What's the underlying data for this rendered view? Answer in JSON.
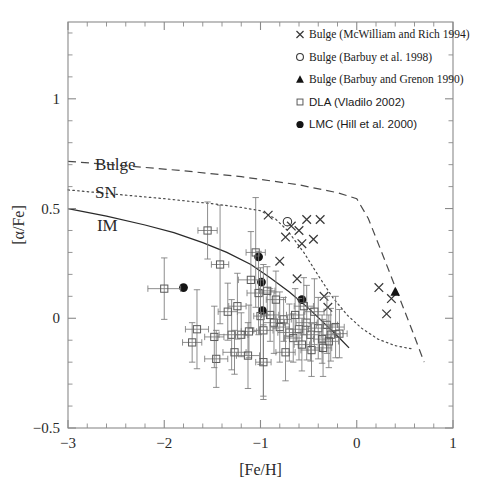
{
  "figure": {
    "title": "",
    "background": "#ffffff"
  },
  "chart_data": {
    "type": "scatter",
    "title": "",
    "xlabel": "[Fe/H]",
    "ylabel": "[α/Fe]",
    "xlim": [
      -3,
      1
    ],
    "ylim": [
      -0.5,
      1.35
    ],
    "xticks": [
      -3,
      -2,
      -1,
      0,
      1
    ],
    "xticklabels": [
      "−3",
      "−2",
      "−1",
      "0",
      "1"
    ],
    "yticks": [
      -0.5,
      0,
      0.5,
      1
    ],
    "yticklabels": [
      "−0.5",
      "0",
      "0.5",
      "1"
    ],
    "x_minor_step": 0.2,
    "y_minor_step": 0.1,
    "grid": false,
    "legend_position": "upper-right",
    "legend": [
      {
        "marker": "x",
        "label": "Bulge (McWilliam and Rich 1994)",
        "font": "serif"
      },
      {
        "marker": "circle-open",
        "label": "Bulge (Barbuy et al. 1998)",
        "font": "serif"
      },
      {
        "marker": "triangle-filled",
        "label": "Bulge (Barbuy and Grenon 1990)",
        "font": "serif"
      },
      {
        "marker": "square-open",
        "label": "DLA (Vladilo 2002)",
        "font": "sans"
      },
      {
        "marker": "circle-filled",
        "label": "LMC (Hill et al. 2000)",
        "font": "sans"
      }
    ],
    "curve_labels": [
      {
        "text": "Bulge",
        "x": -2.72,
        "y": 0.705,
        "style": "dashed"
      },
      {
        "text": "SN",
        "x": -2.72,
        "y": 0.575,
        "style": "dotted"
      },
      {
        "text": "IM",
        "x": -2.7,
        "y": 0.425,
        "style": "solid"
      }
    ],
    "series": [
      {
        "name": "Bulge (McWilliam and Rich 1994)",
        "marker": "x",
        "points": [
          [
            -0.92,
            0.47
          ],
          [
            -0.68,
            0.42
          ],
          [
            -0.52,
            0.45
          ],
          [
            -0.38,
            0.45
          ],
          [
            -0.74,
            0.37
          ],
          [
            -0.6,
            0.4
          ],
          [
            -0.57,
            0.34
          ],
          [
            -0.45,
            0.36
          ],
          [
            -0.8,
            0.26
          ],
          [
            -0.62,
            0.18
          ],
          [
            -0.34,
            0.1
          ],
          [
            -0.3,
            0.05
          ],
          [
            0.36,
            0.09
          ],
          [
            0.31,
            0.02
          ],
          [
            0.23,
            0.14
          ]
        ]
      },
      {
        "name": "Bulge (Barbuy et al. 1998)",
        "marker": "circle-open",
        "points": [
          [
            -0.72,
            0.44
          ]
        ]
      },
      {
        "name": "Bulge (Barbuy and Grenon 1990)",
        "marker": "triangle-filled",
        "points": [
          [
            0.4,
            0.12
          ]
        ]
      },
      {
        "name": "LMC (Hill et al. 2000)",
        "marker": "circle-filled",
        "points": [
          [
            -1.8,
            0.14
          ],
          [
            -1.02,
            0.28
          ],
          [
            -0.99,
            0.165
          ],
          [
            -0.98,
            0.035
          ],
          [
            -0.57,
            0.085
          ]
        ]
      },
      {
        "name": "DLA (Vladilo 2002)",
        "marker": "square-open",
        "errorbars": true,
        "points": [
          [
            -2.0,
            0.135,
            0.17,
            0.14
          ],
          [
            -1.55,
            0.4,
            0.1,
            0.13
          ],
          [
            -1.42,
            0.245,
            0.09,
            0.27
          ],
          [
            -1.3,
            -0.075,
            0.13,
            0.16
          ],
          [
            -1.27,
            -0.155,
            0.12,
            0.1
          ],
          [
            -1.66,
            -0.05,
            0.12,
            0.18
          ],
          [
            -1.71,
            -0.11,
            0.1,
            0.09
          ],
          [
            -1.1,
            0.175,
            0.13,
            0.22
          ],
          [
            -1.05,
            0.3,
            0.1,
            0.25
          ],
          [
            -1.02,
            0.115,
            0.12,
            0.19
          ],
          [
            -1.0,
            0.01,
            0.07,
            0.22
          ],
          [
            -0.97,
            -0.055,
            0.1,
            0.3
          ],
          [
            -1.12,
            -0.06,
            0.08,
            0.12
          ],
          [
            -1.2,
            -0.075,
            0.07,
            0.1
          ],
          [
            -1.46,
            -0.185,
            0.12,
            0.13
          ],
          [
            -0.9,
            0.015,
            0.09,
            0.12
          ],
          [
            -0.86,
            -0.02,
            0.11,
            0.14
          ],
          [
            -0.8,
            -0.04,
            0.1,
            0.16
          ],
          [
            -0.76,
            -0.005,
            0.08,
            0.1
          ],
          [
            -0.7,
            -0.065,
            0.12,
            0.13
          ],
          [
            -0.66,
            -0.09,
            0.09,
            0.11
          ],
          [
            -0.6,
            -0.05,
            0.1,
            0.14
          ],
          [
            -0.57,
            -0.12,
            0.08,
            0.12
          ],
          [
            -0.52,
            -0.02,
            0.11,
            0.17
          ],
          [
            -0.48,
            -0.075,
            0.09,
            0.12
          ],
          [
            -0.44,
            0.03,
            0.1,
            0.15
          ],
          [
            -0.4,
            -0.045,
            0.12,
            0.14
          ],
          [
            -0.36,
            -0.095,
            0.09,
            0.11
          ],
          [
            -0.31,
            -0.03,
            0.11,
            0.13
          ],
          [
            -0.27,
            -0.075,
            0.1,
            0.12
          ],
          [
            -0.22,
            -0.04,
            0.09,
            0.14
          ],
          [
            -0.84,
            0.085,
            0.1,
            0.13
          ],
          [
            -0.93,
            0.125,
            0.08,
            0.11
          ],
          [
            -1.34,
            0.03,
            0.1,
            0.13
          ],
          [
            -1.24,
            0.055,
            0.09,
            0.15
          ],
          [
            -0.64,
            0.015,
            0.09,
            0.12
          ],
          [
            -0.55,
            0.055,
            0.1,
            0.13
          ],
          [
            -0.47,
            -0.145,
            0.11,
            0.12
          ],
          [
            -0.35,
            -0.135,
            0.09,
            0.13
          ],
          [
            -1.48,
            -0.085,
            0.1,
            0.14
          ],
          [
            -1.13,
            -0.17,
            0.12,
            0.15
          ],
          [
            -0.74,
            -0.155,
            0.1,
            0.13
          ],
          [
            -0.29,
            -0.105,
            0.1,
            0.12
          ],
          [
            -0.18,
            -0.07,
            0.08,
            0.11
          ],
          [
            -0.97,
            -0.2,
            0.08,
            0.17
          ]
        ]
      }
    ],
    "model_curves": [
      {
        "name": "Bulge",
        "style": "dashed",
        "points": [
          [
            -3.0,
            0.715
          ],
          [
            -2.4,
            0.695
          ],
          [
            -1.8,
            0.672
          ],
          [
            -1.2,
            0.645
          ],
          [
            -0.6,
            0.608
          ],
          [
            -0.2,
            0.572
          ],
          [
            0.0,
            0.545
          ],
          [
            0.12,
            0.455
          ],
          [
            0.26,
            0.3
          ],
          [
            0.42,
            0.12
          ],
          [
            0.58,
            -0.06
          ],
          [
            0.7,
            -0.2
          ]
        ]
      },
      {
        "name": "SN",
        "style": "dotted",
        "points": [
          [
            -3.0,
            0.585
          ],
          [
            -2.5,
            0.565
          ],
          [
            -2.0,
            0.545
          ],
          [
            -1.5,
            0.522
          ],
          [
            -1.2,
            0.505
          ],
          [
            -1.0,
            0.49
          ],
          [
            -0.85,
            0.455
          ],
          [
            -0.72,
            0.4
          ],
          [
            -0.55,
            0.3
          ],
          [
            -0.4,
            0.195
          ],
          [
            -0.25,
            0.095
          ],
          [
            -0.1,
            0.015
          ],
          [
            0.05,
            -0.045
          ],
          [
            0.22,
            -0.095
          ],
          [
            0.4,
            -0.125
          ],
          [
            0.58,
            -0.14
          ]
        ]
      },
      {
        "name": "IM",
        "style": "solid",
        "points": [
          [
            -3.0,
            0.5
          ],
          [
            -2.6,
            0.465
          ],
          [
            -2.2,
            0.425
          ],
          [
            -1.9,
            0.39
          ],
          [
            -1.6,
            0.345
          ],
          [
            -1.35,
            0.3
          ],
          [
            -1.1,
            0.245
          ],
          [
            -0.9,
            0.185
          ],
          [
            -0.7,
            0.12
          ],
          [
            -0.5,
            0.045
          ],
          [
            -0.32,
            -0.03
          ],
          [
            -0.18,
            -0.09
          ],
          [
            -0.08,
            -0.135
          ]
        ]
      }
    ]
  }
}
